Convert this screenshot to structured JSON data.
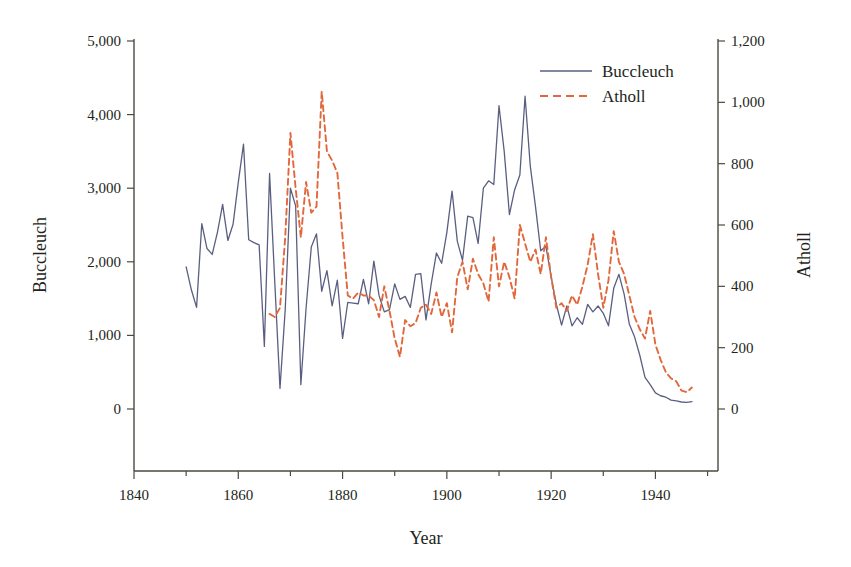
{
  "chart_data": {
    "type": "line",
    "title": "",
    "xlabel": "Year",
    "ylabel": "Buccleuch",
    "y2label": "Atholl",
    "grid": false,
    "legend_position": "top-right",
    "xlim": [
      1840,
      1952
    ],
    "ylim": [
      0,
      5000
    ],
    "y2lim": [
      0,
      1200
    ],
    "x_ticks_major": [
      1840,
      1860,
      1880,
      1900,
      1920,
      1940
    ],
    "x_tick_labels": [
      "1840",
      "1860",
      "1880",
      "1900",
      "1920",
      "1940"
    ],
    "x_ticks_minor": [
      1850,
      1870,
      1890,
      1910,
      1930,
      1950
    ],
    "y_ticks": [
      0,
      1000,
      2000,
      3000,
      4000,
      5000
    ],
    "y_tick_labels": [
      "0",
      "1,000",
      "2,000",
      "3,000",
      "4,000",
      "5,000"
    ],
    "y2_ticks": [
      0,
      200,
      400,
      600,
      800,
      1000,
      1200
    ],
    "y2_tick_labels": [
      "0",
      "200",
      "400",
      "600",
      "800",
      "1,000",
      "1,200"
    ],
    "series": [
      {
        "name": "Buccleuch",
        "axis": "left",
        "color": "#5a5f80",
        "dash": "solid",
        "x": [
          1850,
          1851,
          1852,
          1853,
          1854,
          1855,
          1856,
          1857,
          1858,
          1859,
          1860,
          1861,
          1862,
          1863,
          1864,
          1865,
          1866,
          1867,
          1868,
          1869,
          1870,
          1871,
          1872,
          1873,
          1874,
          1875,
          1876,
          1877,
          1878,
          1879,
          1880,
          1881,
          1882,
          1883,
          1884,
          1885,
          1886,
          1887,
          1888,
          1889,
          1890,
          1891,
          1892,
          1893,
          1894,
          1895,
          1896,
          1897,
          1898,
          1899,
          1900,
          1901,
          1902,
          1903,
          1904,
          1905,
          1906,
          1907,
          1908,
          1909,
          1910,
          1911,
          1912,
          1913,
          1914,
          1915,
          1916,
          1917,
          1918,
          1919,
          1920,
          1921,
          1922,
          1923,
          1924,
          1925,
          1926,
          1927,
          1928,
          1929,
          1930,
          1931,
          1932,
          1933,
          1934,
          1935,
          1936,
          1937,
          1938,
          1939,
          1940,
          1941,
          1942,
          1943,
          1944,
          1945,
          1946,
          1947
        ],
        "values": [
          1930,
          1620,
          1380,
          2520,
          2180,
          2100,
          2400,
          2780,
          2290,
          2510,
          3080,
          3600,
          2300,
          2260,
          2230,
          850,
          3200,
          1720,
          280,
          1350,
          3000,
          2760,
          330,
          1370,
          2200,
          2380,
          1600,
          1880,
          1400,
          1750,
          960,
          1450,
          1440,
          1430,
          1760,
          1430,
          2010,
          1540,
          1320,
          1350,
          1700,
          1490,
          1530,
          1380,
          1830,
          1840,
          1210,
          1700,
          2120,
          1980,
          2400,
          2960,
          2280,
          2020,
          2620,
          2600,
          2250,
          3000,
          3100,
          3050,
          4120,
          3500,
          2640,
          2980,
          3180,
          4250,
          3300,
          2750,
          2150,
          2210,
          1800,
          1420,
          1140,
          1400,
          1130,
          1240,
          1150,
          1420,
          1320,
          1400,
          1300,
          1130,
          1640,
          1830,
          1560,
          1150,
          980,
          730,
          430,
          330,
          220,
          180,
          160,
          120,
          110,
          95,
          90,
          100
        ],
        "style_note": "thin solid navy line"
      },
      {
        "name": "Atholl",
        "axis": "right",
        "color": "#e2683c",
        "dash": "dashed",
        "x": [
          1866,
          1867,
          1868,
          1869,
          1870,
          1871,
          1872,
          1873,
          1874,
          1875,
          1876,
          1877,
          1878,
          1879,
          1880,
          1881,
          1882,
          1883,
          1884,
          1885,
          1886,
          1887,
          1888,
          1889,
          1890,
          1891,
          1892,
          1893,
          1894,
          1895,
          1896,
          1897,
          1898,
          1899,
          1900,
          1901,
          1902,
          1903,
          1904,
          1905,
          1906,
          1907,
          1908,
          1909,
          1910,
          1911,
          1912,
          1913,
          1914,
          1915,
          1916,
          1917,
          1918,
          1919,
          1920,
          1921,
          1922,
          1923,
          1924,
          1925,
          1926,
          1927,
          1928,
          1929,
          1930,
          1931,
          1932,
          1933,
          1934,
          1935,
          1936,
          1937,
          1938,
          1939,
          1940,
          1941,
          1942,
          1943,
          1944,
          1945,
          1946,
          1947
        ],
        "values": [
          310,
          300,
          330,
          560,
          900,
          720,
          560,
          740,
          640,
          660,
          1035,
          840,
          810,
          770,
          560,
          370,
          360,
          380,
          370,
          370,
          355,
          300,
          400,
          320,
          230,
          170,
          290,
          270,
          280,
          330,
          340,
          310,
          380,
          300,
          345,
          250,
          430,
          480,
          390,
          490,
          440,
          410,
          350,
          560,
          400,
          480,
          430,
          360,
          600,
          540,
          480,
          520,
          440,
          560,
          430,
          330,
          345,
          320,
          370,
          340,
          400,
          470,
          570,
          440,
          330,
          420,
          580,
          480,
          440,
          370,
          300,
          260,
          230,
          320,
          210,
          160,
          120,
          100,
          90,
          60,
          55,
          70
        ],
        "style_note": "dashed orange line"
      }
    ]
  },
  "axes": {
    "left_title": "Buccleuch",
    "right_title": "Atholl",
    "bottom_title": "Year"
  },
  "legend": {
    "items": [
      {
        "label": "Buccleuch",
        "color": "#5a5f80",
        "dash": "solid"
      },
      {
        "label": "Atholl",
        "color": "#e2683c",
        "dash": "dashed"
      }
    ]
  },
  "colors": {
    "buccleuch": "#5a5f80",
    "atholl": "#e2683c",
    "axis": "#4b4a3f",
    "text": "#231f20",
    "background": "#ffffff"
  }
}
